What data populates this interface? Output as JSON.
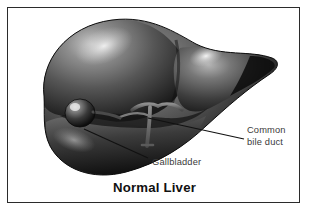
{
  "figure": {
    "title": "Normal Liver",
    "style": "grayscale medical illustration",
    "border_color": "#2b2b2b",
    "background_color": "#ffffff"
  },
  "labels": [
    {
      "id": "common-bile-duct",
      "line1": "Common",
      "line2": "bile duct",
      "text_color": "#3a3a3a",
      "leader_line": {
        "from_x": 148,
        "from_y": 118,
        "to_x": 244,
        "to_y": 139
      }
    },
    {
      "id": "gallbladder",
      "line1": "Gallbladder",
      "line2": "",
      "text_color": "#3a3a3a",
      "leader_line": {
        "from_x": 84,
        "from_y": 129,
        "to_x": 148,
        "to_y": 158
      }
    }
  ],
  "anatomy": {
    "right_lobe": "right lobe of liver",
    "left_lobe": "left lobe of liver",
    "gallbladder": "gallbladder",
    "common_bile_duct": "common bile duct",
    "liver_color_dark": "#1c1c1c",
    "liver_color_mid": "#4f4f4f",
    "liver_color_light": "#9a9a9a",
    "highlight_color": "#d8d8d8"
  }
}
